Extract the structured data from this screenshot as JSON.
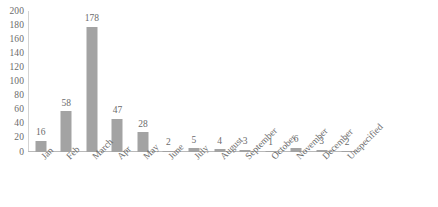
{
  "chart_data": {
    "type": "bar",
    "title": "",
    "subtitle": "",
    "xlabel": "",
    "ylabel": "",
    "categories": [
      "Jan",
      "Feb",
      "March",
      "Apr",
      "May",
      "June",
      "July",
      "August",
      "September",
      "October",
      "November",
      "December",
      "Unspecified"
    ],
    "values": [
      16,
      58,
      178,
      47,
      28,
      2,
      5,
      4,
      3,
      1,
      6,
      3,
      2
    ],
    "data_labels": [
      "16",
      "58",
      "178",
      "47",
      "28",
      "2",
      "5",
      "4",
      "3",
      "1",
      "6",
      "3",
      "2"
    ],
    "ylim": [
      0,
      200
    ],
    "ytick_values": [
      0,
      20,
      40,
      60,
      80,
      100,
      120,
      140,
      160,
      180,
      200
    ],
    "ytick_labels": [
      "200",
      "180",
      "160",
      "140",
      "120",
      "100",
      "80",
      "60",
      "40",
      "20",
      "0"
    ],
    "grid": false,
    "legend": false,
    "legend_position": "none",
    "series": [
      {
        "name": "Count",
        "values": [
          16,
          58,
          178,
          47,
          28,
          2,
          5,
          4,
          3,
          1,
          6,
          3,
          2
        ]
      }
    ],
    "colors": {
      "bar_fill": "#a3a3a3",
      "axis_line": "#b9b9b9",
      "tick_text": "#6b6b6b",
      "background": "#ffffff"
    }
  }
}
